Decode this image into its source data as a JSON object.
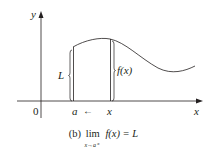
{
  "figure": {
    "axes": {
      "x_label": "x",
      "y_label": "y",
      "origin_label": "0"
    },
    "markers": {
      "a_label": "a",
      "x_label": "x",
      "approach_arrow": "←"
    },
    "braces": {
      "left_label": "L",
      "right_label": "f(x)"
    },
    "caption": {
      "prefix": "(b)",
      "lim": "lim",
      "subscript": "x→a⁺",
      "function": "f(x)",
      "equals": "= L"
    },
    "colors": {
      "line": "#231f20",
      "background": "#ffffff"
    }
  }
}
